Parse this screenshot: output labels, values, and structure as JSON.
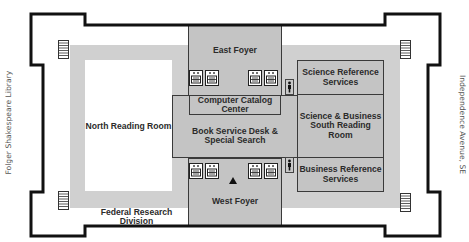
{
  "map": {
    "title": "Library floor plan",
    "side_labels": {
      "left": "Folger Shakespeare Library",
      "right": "Independence Avenue, SE"
    },
    "rooms": {
      "east_foyer": "East Foyer",
      "west_foyer": "West Foyer",
      "north_reading_room": "North Reading Room",
      "computer_catalog": "Computer Catalog Center",
      "book_service": "Book Service Desk & Special Search",
      "science_reference": "Science Reference Services",
      "science_business_reading": "Science & Business South Reading Room",
      "business_reference": "Business Reference Services",
      "federal_research": "Federal Research Division"
    },
    "room_lines": {
      "computer_catalog": [
        "Computer Catalog",
        "Center"
      ],
      "book_service": [
        "Book Service Desk &",
        "Special Search"
      ],
      "science_reference": [
        "Science Reference",
        "Services"
      ],
      "science_business_reading": [
        "Science & Business",
        "South Reading Room"
      ],
      "business_reference": [
        "Business Reference",
        "Services"
      ]
    },
    "icons": {
      "elevators": 8,
      "stairs": 4,
      "restrooms": 2,
      "you_are_here_marker": "triangle"
    },
    "colors": {
      "wall": "#111111",
      "corridor": "#d0d0d0",
      "room_fill": "#c4c4c4",
      "room_border": "#3a3a3a",
      "background": "#ffffff"
    }
  }
}
